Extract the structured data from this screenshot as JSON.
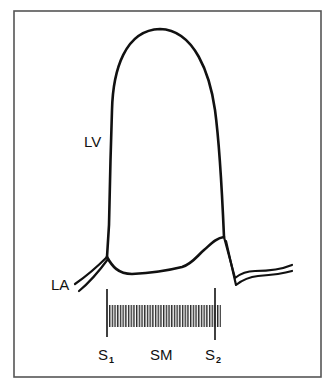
{
  "diagram": {
    "type": "pressure-tracing",
    "colors": {
      "line": "#111111",
      "frame": "#555555",
      "background": "#ffffff"
    },
    "frame": {
      "x1": 14,
      "y1": 11,
      "x2": 321,
      "y2": 377
    },
    "labels": {
      "lv": "LV",
      "la": "LA",
      "s1_main": "S",
      "s1_sub": "1",
      "sm": "SM",
      "s2_main": "S",
      "s2_sub": "2"
    },
    "traces": [
      {
        "name": "LV",
        "description": "Left ventricular pressure"
      },
      {
        "name": "LA",
        "description": "Left atrial pressure (double line)"
      }
    ],
    "markers": [
      {
        "name": "S1",
        "x": 107
      },
      {
        "name": "S2",
        "x": 215
      }
    ],
    "murmur": {
      "name": "SM",
      "x_start": 109,
      "x_end": 221,
      "y_top": 305,
      "y_bottom": 327,
      "spacing": 2.7
    }
  }
}
